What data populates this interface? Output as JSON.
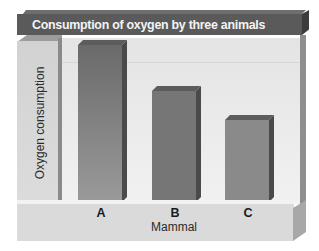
{
  "chart_data": {
    "type": "bar",
    "title": "Consumption of oxygen by three animals",
    "xlabel": "Mammal",
    "ylabel": "Oxygen consumption",
    "categories": [
      "A",
      "B",
      "C"
    ],
    "values": [
      100,
      71,
      52
    ],
    "value_units": "relative (A = 100); no y-axis ticks shown",
    "ylim": [
      0,
      100
    ],
    "grid": false,
    "legend": null,
    "style": "3D bars, grayscale"
  },
  "colors": {
    "banner": "#5a5a5a",
    "banner_text": "#f4f4f4",
    "bar_A": "#6a6a6a",
    "bar_B": "#767676",
    "bar_C": "#8a8a8a",
    "panel": "#ebebeb",
    "floor": "#dadada"
  }
}
